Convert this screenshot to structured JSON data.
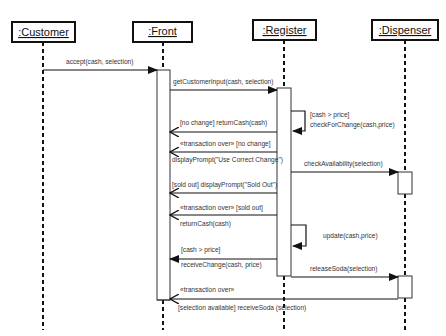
{
  "diagram": {
    "type": "UML sequence diagram",
    "lifelines": [
      {
        "id": "customer",
        "label": ":Customer",
        "x": 43
      },
      {
        "id": "front",
        "label": ":Front",
        "x": 163
      },
      {
        "id": "register",
        "label": ":Register",
        "x": 284
      },
      {
        "id": "dispenser",
        "label": ":Dispenser",
        "x": 405
      }
    ],
    "messages": [
      {
        "label": "accept(cash, selection)",
        "from": "customer",
        "to": "front"
      },
      {
        "label": "getCustomerInput(cash, selection)",
        "from": "front",
        "to": "register"
      },
      {
        "label_line1": "[cash > price]",
        "label_line2": "checkForChange(cash,price)",
        "from": "register",
        "to": "register"
      },
      {
        "label": "[no change] returnCash(cash)",
        "from": "register",
        "to": "front"
      },
      {
        "label": "«transaction over» [no change]",
        "from": "register",
        "to": "front"
      },
      {
        "label": "displayPrompt(\"Use Correct Change\")",
        "from": "register",
        "to": "front"
      },
      {
        "label": "checkAvailability(selection)",
        "from": "register",
        "to": "dispenser"
      },
      {
        "label": "[sold out] displayPrompt(\"Sold Out\")",
        "from": "register",
        "to": "front"
      },
      {
        "label": "«transaction over» [sold out]",
        "from": "register",
        "to": "front"
      },
      {
        "label": "returnCash(cash)",
        "from": "register",
        "to": "front"
      },
      {
        "label": "update(cash,price)",
        "from": "register",
        "to": "register"
      },
      {
        "label": "[cash > price]",
        "from": "register",
        "to": "front"
      },
      {
        "label": "receiveChange(cash, price)",
        "from": "register",
        "to": "front"
      },
      {
        "label": "releaseSoda(selection)",
        "from": "register",
        "to": "dispenser"
      },
      {
        "label": "«transaction over»",
        "from": "dispenser",
        "to": "front"
      },
      {
        "label": "[selection available] receiveSoda (selection)",
        "from": "dispenser",
        "to": "front"
      }
    ]
  }
}
